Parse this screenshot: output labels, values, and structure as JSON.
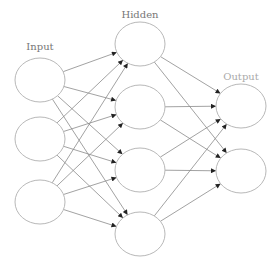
{
  "diagram": {
    "colors": {
      "node_stroke": "#b8b8b8",
      "edge": "#8a8a8a",
      "label": "#777777",
      "output_label": "#aaaaaa"
    },
    "node_radius": {
      "rx": 25,
      "ry": 22
    },
    "layers": [
      {
        "id": "input",
        "label": "Input",
        "label_pos": {
          "x": 40,
          "y": 50
        },
        "nodes": [
          {
            "id": "i1",
            "cx": 40,
            "cy": 80
          },
          {
            "id": "i2",
            "cx": 40,
            "cy": 139
          },
          {
            "id": "i3",
            "cx": 40,
            "cy": 202
          }
        ]
      },
      {
        "id": "hidden",
        "label": "Hidden",
        "label_pos": {
          "x": 140,
          "y": 18
        },
        "nodes": [
          {
            "id": "h1",
            "cx": 140,
            "cy": 44
          },
          {
            "id": "h2",
            "cx": 140,
            "cy": 107
          },
          {
            "id": "h3",
            "cx": 140,
            "cy": 170
          },
          {
            "id": "h4",
            "cx": 140,
            "cy": 234
          }
        ]
      },
      {
        "id": "output",
        "label": "Output",
        "label_pos": {
          "x": 241,
          "y": 80
        },
        "nodes": [
          {
            "id": "o1",
            "cx": 241,
            "cy": 106
          },
          {
            "id": "o2",
            "cx": 241,
            "cy": 171
          }
        ]
      }
    ],
    "connectivity": "fully-connected between adjacent layers, directed left to right"
  }
}
